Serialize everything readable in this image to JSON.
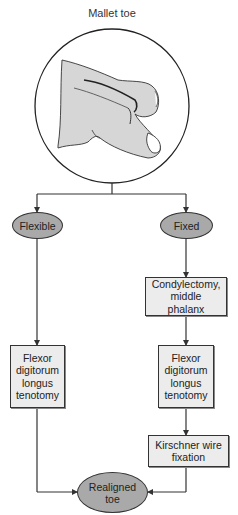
{
  "diagram": {
    "title": "Mallet toe",
    "illustration": "mallet-toe-drawing",
    "nodes": {
      "flexible": "Flexible",
      "fixed": "Fixed",
      "condylectomy": "Condylectomy,\nmiddle\nphalanx",
      "flexor_left": "Flexor\ndigitorum\nlongus\ntenotomy",
      "flexor_right": "Flexor\ndigitorum\nlongus\ntenotomy",
      "kirschner": "Kirschner wire\nfixation",
      "realigned": "Realigned\ntoe"
    },
    "edges": [
      [
        "Mallet toe",
        "Flexible"
      ],
      [
        "Mallet toe",
        "Fixed"
      ],
      [
        "Flexible",
        "Flexor digitorum longus tenotomy (left)"
      ],
      [
        "Fixed",
        "Condylectomy, middle phalanx"
      ],
      [
        "Condylectomy, middle phalanx",
        "Flexor digitorum longus tenotomy (right)"
      ],
      [
        "Flexor digitorum longus tenotomy (right)",
        "Kirschner wire fixation"
      ],
      [
        "Flexor digitorum longus tenotomy (left)",
        "Realigned toe"
      ],
      [
        "Kirschner wire fixation",
        "Realigned toe"
      ]
    ],
    "colors": {
      "oval_fill": "#a9a9a9",
      "box_fill": "#ececec",
      "stroke": "#333333"
    }
  }
}
